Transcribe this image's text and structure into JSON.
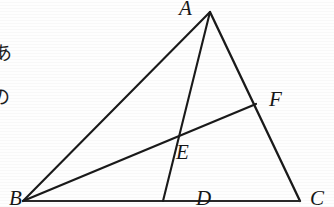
{
  "figure": {
    "kind": "euclidean-geometry-diagram",
    "canvas": {
      "width": 334,
      "height": 207
    },
    "background_color": "#fefefe",
    "ink_color": "#1a1a1a",
    "stroke_width": 2.1
  },
  "points": {
    "A": {
      "label": "A",
      "x": 210,
      "y": 12,
      "label_x": 179,
      "label_y": -2
    },
    "B": {
      "label": "B",
      "x": 23,
      "y": 201,
      "label_x": 9,
      "label_y": 188
    },
    "C": {
      "label": "C",
      "x": 300,
      "y": 201,
      "label_x": 310,
      "label_y": 188
    },
    "D": {
      "label": "D",
      "x": 163,
      "y": 201,
      "label_x": 196,
      "label_y": 188
    },
    "E": {
      "label": "E",
      "x": 172,
      "y": 139,
      "label_x": 176,
      "label_y": 142
    },
    "F": {
      "label": "F",
      "x": 256,
      "y": 104,
      "label_x": 269,
      "label_y": 89
    }
  },
  "segments": [
    {
      "name": "side-AB",
      "from": "A",
      "to": "B"
    },
    {
      "name": "side-AC",
      "from": "A",
      "to": "C"
    },
    {
      "name": "side-BC",
      "from": "B",
      "to": "C"
    },
    {
      "name": "cevian-AD",
      "from": "A",
      "to": "D"
    },
    {
      "name": "cevian-BF",
      "from": "B",
      "to": "F"
    }
  ],
  "margin_text": {
    "char_1": "あ",
    "char_2": "の"
  }
}
